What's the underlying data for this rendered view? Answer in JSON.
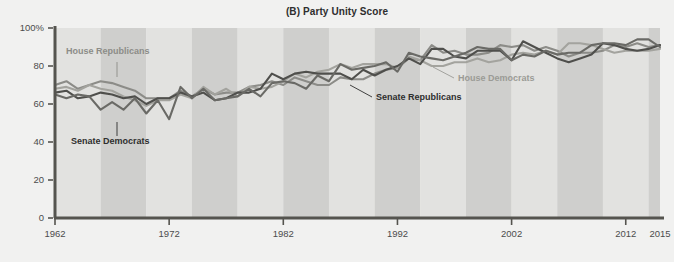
{
  "figure": {
    "title": "(B) Party Unity Score",
    "background_color": "#f1f1f0",
    "plot_band_light": "#e2e2e0",
    "plot_band_dark": "#cfcfcd",
    "axis_color": "#55544f"
  },
  "chart_data": {
    "type": "line",
    "title": "(B) Party Unity Score",
    "xlabel": "",
    "ylabel": "",
    "xlim": [
      1962,
      2015
    ],
    "ylim": [
      0,
      100
    ],
    "grid": false,
    "legend": "annotations-on-plot",
    "ytick_labels": [
      "0",
      "20",
      "40",
      "60",
      "80",
      "100%"
    ],
    "ytick_values": [
      0,
      20,
      40,
      60,
      80,
      100
    ],
    "xtick_labels": [
      "1962",
      "1972",
      "1982",
      "1992",
      "2002",
      "2012",
      "2015"
    ],
    "xtick_values": [
      1962,
      1972,
      1982,
      1992,
      2002,
      2012,
      2015
    ],
    "x": [
      1962,
      1963,
      1964,
      1965,
      1966,
      1967,
      1968,
      1969,
      1970,
      1971,
      1972,
      1973,
      1974,
      1975,
      1976,
      1977,
      1978,
      1979,
      1980,
      1981,
      1982,
      1983,
      1984,
      1985,
      1986,
      1987,
      1988,
      1989,
      1990,
      1991,
      1992,
      1993,
      1994,
      1995,
      1996,
      1997,
      1998,
      1999,
      2000,
      2001,
      2002,
      2003,
      2004,
      2005,
      2006,
      2007,
      2008,
      2009,
      2010,
      2011,
      2012,
      2013,
      2014,
      2015
    ],
    "series": [
      {
        "name": "House Republicans",
        "color": "#8c8c88",
        "values": [
          70,
          72,
          68,
          70,
          72,
          71,
          69,
          67,
          63,
          63,
          63,
          67,
          64,
          68,
          65,
          66,
          66,
          69,
          70,
          72,
          70,
          74,
          72,
          70,
          70,
          74,
          73,
          73,
          76,
          78,
          79,
          84,
          83,
          91,
          87,
          88,
          86,
          86,
          87,
          91,
          90,
          91,
          88,
          90,
          88,
          85,
          87,
          87,
          88,
          91,
          90,
          92,
          90,
          91
        ]
      },
      {
        "name": "House Democrats",
        "color": "#a3a39e",
        "values": [
          68,
          69,
          67,
          70,
          68,
          67,
          64,
          62,
          59,
          62,
          62,
          65,
          63,
          69,
          65,
          68,
          64,
          69,
          68,
          69,
          72,
          76,
          74,
          77,
          78,
          81,
          79,
          81,
          81,
          81,
          79,
          85,
          83,
          80,
          80,
          82,
          82,
          84,
          82,
          83,
          86,
          87,
          86,
          88,
          86,
          92,
          92,
          91,
          89,
          87,
          88,
          88,
          88,
          89
        ]
      },
      {
        "name": "Senate Republicans",
        "color": "#4f4f4c"
      },
      {
        "name": "Senate Democrats",
        "color": "#6a6a66"
      }
    ],
    "series_senate_republicans_values": [
      66,
      67,
      63,
      64,
      66,
      65,
      63,
      64,
      60,
      63,
      63,
      66,
      64,
      66,
      62,
      63,
      66,
      66,
      68,
      76,
      73,
      76,
      77,
      76,
      76,
      76,
      73,
      78,
      75,
      78,
      80,
      84,
      81,
      89,
      89,
      85,
      84,
      88,
      88,
      88,
      83,
      93,
      90,
      87,
      84,
      82,
      84,
      86,
      92,
      91,
      89,
      88,
      89,
      91
    ],
    "series_senate_democrats_values": [
      65,
      63,
      65,
      64,
      57,
      61,
      57,
      63,
      55,
      62,
      52,
      69,
      63,
      68,
      62,
      63,
      64,
      68,
      64,
      71,
      72,
      71,
      68,
      75,
      72,
      81,
      78,
      79,
      80,
      82,
      77,
      87,
      85,
      84,
      83,
      85,
      87,
      90,
      89,
      89,
      83,
      86,
      85,
      88,
      86,
      87,
      87,
      91,
      92,
      92,
      91,
      94,
      94,
      90
    ],
    "annotations": [
      {
        "text": "House Republicans",
        "color": "#8c8c88",
        "x_px": 66,
        "y_px": 54,
        "leader_from": [
          117,
          62
        ],
        "leader_to": [
          117,
          77
        ]
      },
      {
        "text": "Senate Democrats",
        "color": "#2e2e2e",
        "x_px": 71,
        "y_px": 144,
        "leader_from": [
          117,
          122
        ],
        "leader_to": [
          117,
          136
        ]
      },
      {
        "text": "House Democrats",
        "color": "#9b9b96",
        "x_px": 458,
        "y_px": 81,
        "leader_from": [
          454,
          78
        ],
        "leader_to": [
          433,
          67
        ]
      },
      {
        "text": "Senate Republicans",
        "color": "#2e2e2e",
        "x_px": 376,
        "y_px": 100,
        "leader_from": [
          372,
          97
        ],
        "leader_to": [
          350,
          85
        ]
      }
    ],
    "shaded_bands": {
      "description": "alternating vertical bands marking congressional terms",
      "start_year": 1962,
      "period_years": 4
    }
  }
}
